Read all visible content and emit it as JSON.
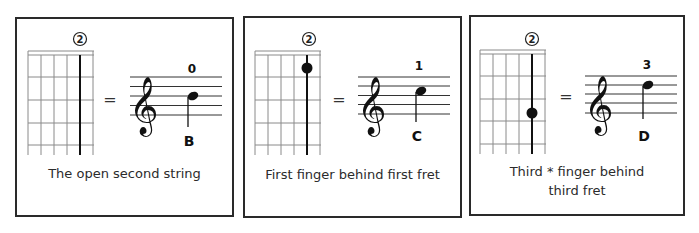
{
  "panels": [
    {
      "string_marker": "2",
      "fret_dot": null,
      "equals": "=",
      "fingering": "0",
      "note_name": "B",
      "note_staff_position": "middle line",
      "caption": "The open second string"
    },
    {
      "string_marker": "2",
      "fret_dot": 1,
      "equals": "=",
      "fingering": "1",
      "note_name": "C",
      "note_staff_position": "third space",
      "caption": "First finger behind first fret"
    },
    {
      "string_marker": "2",
      "fret_dot": 3,
      "equals": "=",
      "fingering": "3",
      "note_name": "D",
      "note_staff_position": "fourth line",
      "caption": "Third * finger behind\nthird fret"
    }
  ],
  "colors": {
    "border": "#2a2a2a",
    "grid": "#8a8a8a",
    "ink": "#111111",
    "text": "#2b2b2b"
  }
}
